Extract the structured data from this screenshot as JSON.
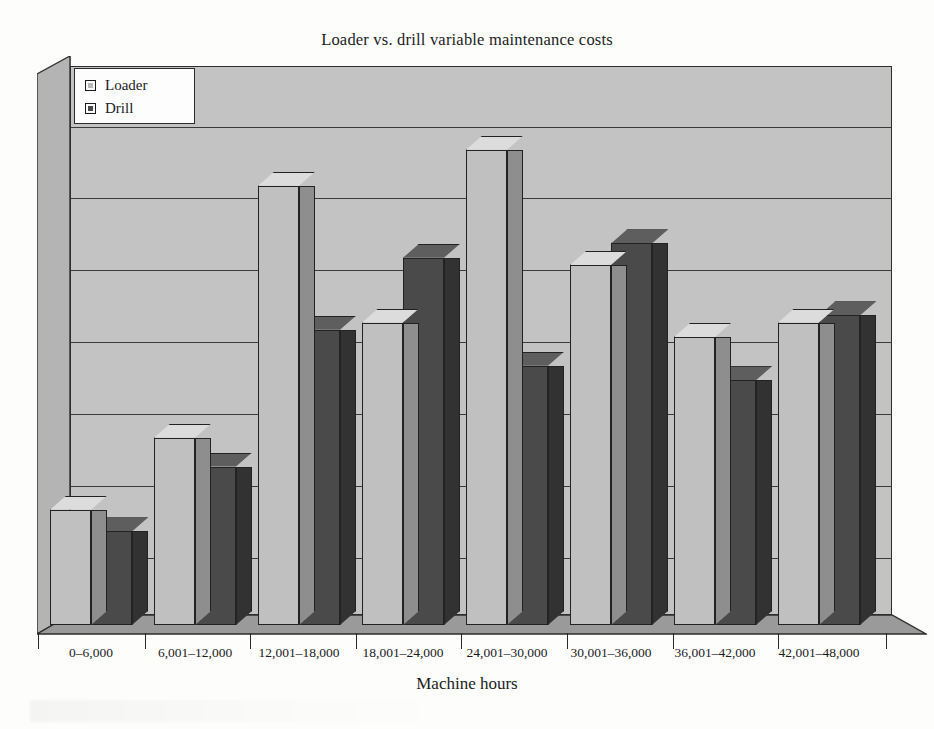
{
  "chart_data": {
    "type": "bar",
    "title": "Loader vs. drill variable maintenance costs",
    "xlabel": "Machine hours",
    "ylabel": "",
    "grid": true,
    "legend_position": "top-left",
    "y_gridline_count": 8,
    "ylim": [
      0,
      8
    ],
    "categories": [
      "0–6,000",
      "6,001–12,000",
      "12,001–18,000",
      "18,001–24,000",
      "24,001–30,000",
      "30,001–36,000",
      "36,001–42,000",
      "42,001–48,000"
    ],
    "series": [
      {
        "name": "Loader",
        "color": "#c0c0c0",
        "values": [
          1.6,
          2.6,
          6.1,
          4.2,
          6.6,
          5.0,
          4.0,
          4.2
        ]
      },
      {
        "name": "Drill",
        "color": "#4a4a4a",
        "values": [
          1.3,
          2.2,
          4.1,
          5.1,
          3.6,
          5.3,
          3.4,
          4.3
        ]
      }
    ]
  },
  "chart": {
    "title": "Loader vs. drill variable maintenance costs",
    "axis_title_x": "Machine hours",
    "legend": {
      "items": [
        {
          "label": "Loader",
          "color": "#c0c0c0"
        },
        {
          "label": "Drill",
          "color": "#4a4a4a"
        }
      ]
    },
    "colors": {
      "loader_face": "#c0c0c0",
      "loader_side": "#8e8e8e",
      "loader_top": "#dcdcdc",
      "drill_face": "#4a4a4a",
      "drill_side": "#323232",
      "drill_top": "#5e5e5e",
      "back_wall": "#c3c3c3",
      "left_wall": "#b4b4b4",
      "floor": "#9a9a9a",
      "outline": "#222222"
    }
  }
}
